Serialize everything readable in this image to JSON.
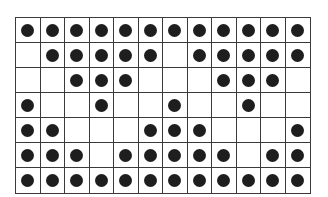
{
  "grid": {
    "rows": 7,
    "cols": 12,
    "dot_color": "#1e1e1e",
    "line_color": "#3a3a3a",
    "cells": [
      [
        1,
        1,
        1,
        1,
        1,
        1,
        1,
        1,
        1,
        1,
        1,
        1
      ],
      [
        0,
        1,
        1,
        1,
        1,
        1,
        0,
        1,
        1,
        1,
        1,
        1
      ],
      [
        0,
        0,
        1,
        1,
        1,
        0,
        0,
        0,
        1,
        1,
        1,
        0
      ],
      [
        1,
        0,
        0,
        1,
        0,
        0,
        1,
        0,
        0,
        1,
        0,
        0
      ],
      [
        1,
        1,
        0,
        0,
        0,
        1,
        1,
        1,
        0,
        0,
        0,
        1
      ],
      [
        1,
        1,
        1,
        0,
        1,
        1,
        1,
        1,
        1,
        0,
        1,
        1
      ],
      [
        1,
        1,
        1,
        1,
        1,
        1,
        1,
        1,
        1,
        1,
        1,
        1
      ]
    ]
  }
}
